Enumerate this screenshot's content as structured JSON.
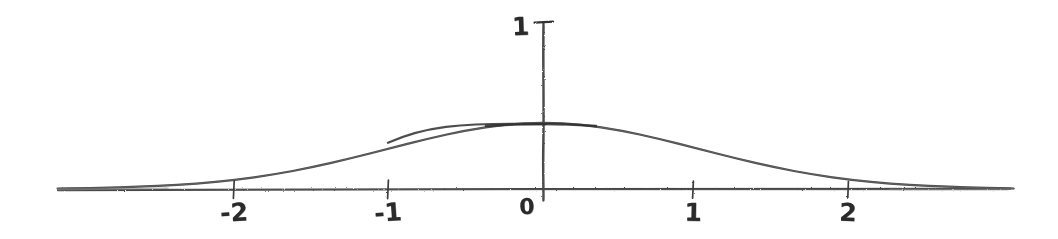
{
  "figure": {
    "kind": "hand-drawn-sketch",
    "background_color": "#ffffff",
    "ink_color": "#3a3a3a",
    "width": 1058,
    "height": 239
  },
  "chart_data": {
    "type": "line",
    "title": "",
    "subtitle": "",
    "xlabel": "",
    "ylabel": "",
    "style": "hand-drawn pencil sketch",
    "curve_name": "standard normal probability density",
    "formula": "f(x) = (1/sqrt(2*pi)) * exp(-x^2/2)",
    "grid": false,
    "legend": null,
    "xlim": [
      -3.15,
      3.05
    ],
    "ylim": [
      0,
      1.0
    ],
    "x_axis": {
      "tick_values": [
        -2,
        -1,
        0,
        1,
        2
      ],
      "tick_labels": [
        "-2",
        "-1",
        "0",
        "1",
        "2"
      ],
      "line_drawn_from": -3.15,
      "line_drawn_to": 3.05
    },
    "y_axis": {
      "tick_values": [
        1
      ],
      "tick_labels": [
        "1"
      ],
      "line_drawn_from": 0.0,
      "line_drawn_to": 1.0
    },
    "x": [
      -3.15,
      -3.0,
      -2.75,
      -2.5,
      -2.25,
      -2.0,
      -1.75,
      -1.5,
      -1.25,
      -1.0,
      -0.75,
      -0.5,
      -0.25,
      0.0,
      0.25,
      0.5,
      0.75,
      1.0,
      1.25,
      1.5,
      1.75,
      2.0,
      2.25,
      2.5,
      2.75,
      3.0,
      3.05
    ],
    "values": [
      0.003,
      0.004,
      0.009,
      0.018,
      0.032,
      0.054,
      0.086,
      0.13,
      0.183,
      0.242,
      0.301,
      0.352,
      0.387,
      0.399,
      0.387,
      0.352,
      0.301,
      0.242,
      0.183,
      0.13,
      0.086,
      0.054,
      0.032,
      0.018,
      0.009,
      0.004,
      0.003
    ],
    "annotations": [
      {
        "text": "1",
        "role": "y-axis-tick-label",
        "at_value": 1.0
      },
      {
        "text": "0",
        "role": "origin-label",
        "at_value": 0
      },
      {
        "text": "-2",
        "role": "x-axis-tick-label",
        "at_value": -2
      },
      {
        "text": "-1",
        "role": "x-axis-tick-label",
        "at_value": -1
      },
      {
        "text": "1",
        "role": "x-axis-tick-label",
        "at_value": 1
      },
      {
        "text": "2",
        "role": "x-axis-tick-label",
        "at_value": 2
      }
    ]
  },
  "labels": {
    "y_one": "1",
    "origin": "0",
    "x_minus_two": "-2",
    "x_minus_one": "-1",
    "x_one": "1",
    "x_two": "2"
  }
}
